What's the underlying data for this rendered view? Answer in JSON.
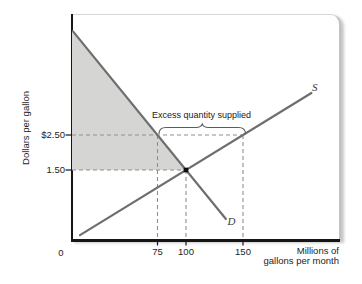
{
  "figure": {
    "ylabel": "Dollars per gallon",
    "xlabel_line1": "Millions of",
    "xlabel_line2": "gallons per month",
    "origin_label": "0",
    "price_labels": {
      "p250": "$2.50",
      "p150": "1.50"
    },
    "qty_labels": {
      "q75": "75",
      "q100": "100",
      "q150": "150"
    },
    "annotation": "Excess quantity supplied",
    "demand_label": "D",
    "supply_label": "S"
  },
  "colors": {
    "curve": "#6e6e6e",
    "dashed": "#8f8f8f",
    "shade": "#d5d5d3",
    "axis": "#161616",
    "brace": "#5c5c5c",
    "dot": "#0d0d0d"
  },
  "chart_data": {
    "type": "line",
    "title": "",
    "xlabel": "Millions of gallons per month",
    "ylabel": "Dollars per gallon",
    "x_ticks": [
      0,
      75,
      100,
      150
    ],
    "y_ticks": [
      2.5,
      1.5
    ],
    "y_tick_labels": [
      "$2.50",
      "1.50"
    ],
    "xlim": [
      0,
      236
    ],
    "ylim": [
      -0.5,
      6.0
    ],
    "grid": false,
    "legend": "inline curve labels D and S",
    "series": [
      {
        "name": "D",
        "role": "demand",
        "points_qp": [
          [
            0.9,
            5.46
          ],
          [
            135,
            0.1
          ]
        ]
      },
      {
        "name": "S",
        "role": "supply",
        "points_qp": [
          [
            7,
            -0.36
          ],
          [
            210,
            3.7
          ]
        ]
      }
    ],
    "equilibrium": {
      "quantity": 100,
      "price": 1.5
    },
    "excess_quantity_supplied": {
      "price": 2.5,
      "quantity_demanded": 75,
      "quantity_supplied": 150,
      "excess": 75
    },
    "shaded_region_qp": [
      [
        0,
        5.5
      ],
      [
        0,
        1.5
      ],
      [
        100,
        1.5
      ]
    ],
    "dashed_guides": [
      {
        "q1": 0,
        "p1": 2.5,
        "q2": 150,
        "p2": 2.5
      },
      {
        "q1": 0,
        "p1": 1.5,
        "q2": 100,
        "p2": 1.5
      },
      {
        "q1": 75,
        "p1": 2.5,
        "q2": 75,
        "p2": "axis"
      },
      {
        "q1": 100,
        "p1": 1.5,
        "q2": 100,
        "p2": "axis"
      },
      {
        "q1": 150,
        "p1": 2.5,
        "q2": 150,
        "p2": "axis"
      }
    ]
  }
}
